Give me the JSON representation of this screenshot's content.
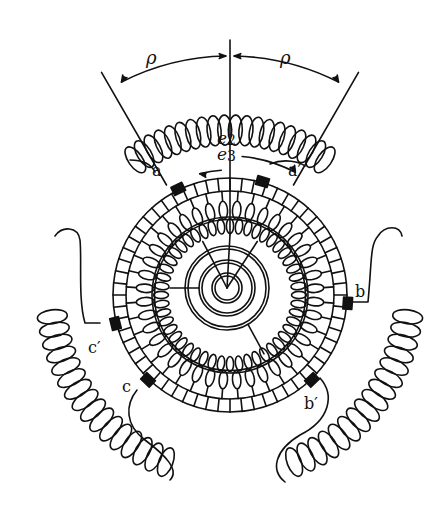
{
  "figure": {
    "labels": {
      "rho_left": "ρ",
      "rho_right": "ρ",
      "e2": "e",
      "e2_sub": "2",
      "e3": "e",
      "e3_sub": "3",
      "a": "a",
      "a_prime": "a′",
      "b": "b",
      "b_prime": "b′",
      "c": "c",
      "c_prime": "c′"
    },
    "colors": {
      "ink": "#111111",
      "background": "#ffffff"
    },
    "geometry": {
      "center": [
        230,
        295
      ],
      "outer_ring_radius": 117,
      "commutator_inner_radius": 104,
      "armature_ring_radius": 78,
      "hub_center": [
        227,
        288
      ],
      "hub_radii": [
        42,
        28,
        15
      ],
      "commutator_segments": 60,
      "outer_coil_loops": 40,
      "inner_coil_loops": 48
    }
  }
}
